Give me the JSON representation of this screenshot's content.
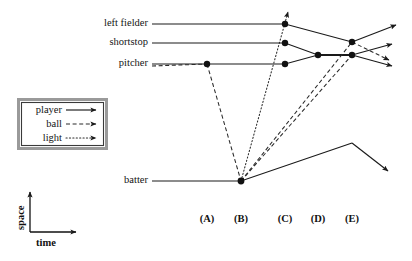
{
  "diagram": {
    "axes": {
      "x_label": "time",
      "y_label": "space",
      "origin": [
        30,
        232
      ],
      "x_arrow_end": [
        78,
        232
      ],
      "y_arrow_end": [
        30,
        190
      ]
    },
    "worldline_labels": [
      {
        "name": "left-fielder",
        "text": "left fielder",
        "y": 24
      },
      {
        "name": "shortstop",
        "text": "shortstop",
        "y": 43
      },
      {
        "name": "pitcher",
        "text": "pitcher",
        "y": 64
      },
      {
        "name": "batter",
        "text": "batter",
        "y": 181
      }
    ],
    "time_ticks": [
      {
        "label": "(A)",
        "x": 207
      },
      {
        "label": "(B)",
        "x": 241
      },
      {
        "label": "(C)",
        "x": 285
      },
      {
        "label": "(D)",
        "x": 318
      },
      {
        "label": "(E)",
        "x": 352
      }
    ],
    "legend": {
      "entries": [
        {
          "name": "player",
          "label": "player",
          "style": "solid"
        },
        {
          "name": "ball",
          "label": "ball",
          "style": "dashed"
        },
        {
          "name": "light",
          "label": "light",
          "style": "dotted"
        }
      ]
    },
    "colors": {
      "line": "#1a1a1a",
      "node": "#111111",
      "legend_border_outer": "#9a9a9a",
      "legend_border_inner": "#3a3a3a",
      "background": "#ffffff"
    },
    "events": [
      {
        "name": "pitcher-release",
        "x": 207,
        "y": 64
      },
      {
        "name": "batter-hit",
        "x": 241,
        "y": 181
      },
      {
        "name": "left-fielder-sees",
        "x": 285,
        "y": 24
      },
      {
        "name": "shortstop-sees",
        "x": 285,
        "y": 43
      },
      {
        "name": "pitcher-sees",
        "x": 285,
        "y": 64
      },
      {
        "name": "shortstop-pitcher-meet",
        "x": 318,
        "y": 55
      },
      {
        "name": "left-fielder-catch",
        "x": 352,
        "y": 42
      },
      {
        "name": "fielders-converge",
        "x": 352,
        "y": 55
      }
    ]
  }
}
